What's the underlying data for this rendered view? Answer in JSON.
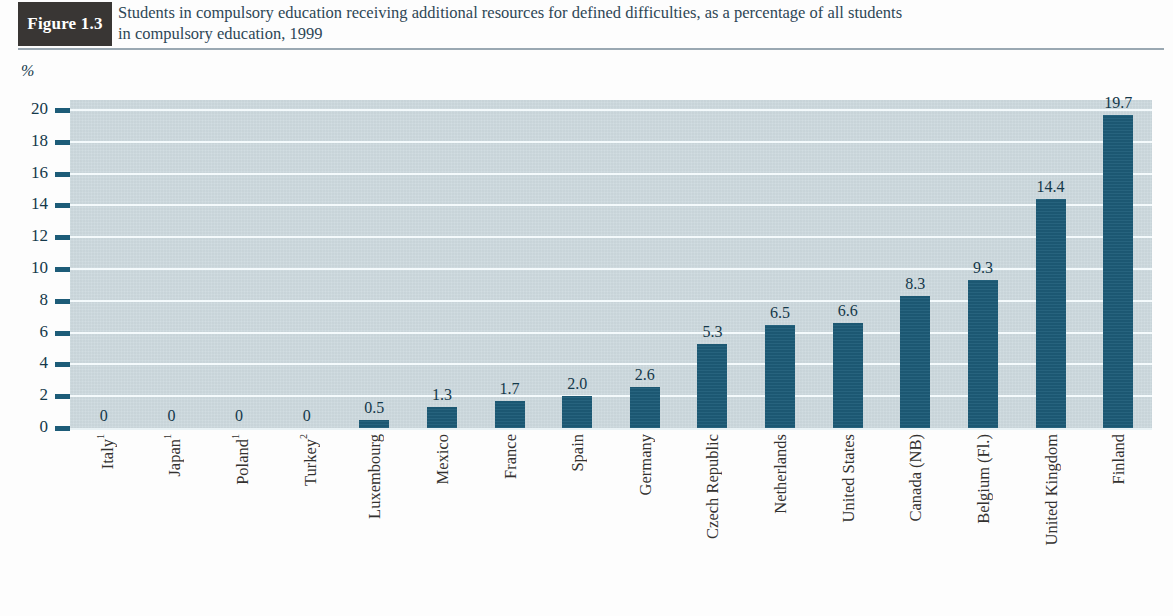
{
  "figure": {
    "tag": "Figure 1.3",
    "title_line1": "Students in compulsory education receiving additional resources for defined difficulties, as a percentage of all students",
    "title_line2": "in compulsory education, 1999"
  },
  "colors": {
    "bar": "#1d5c78",
    "plot_background": "#ccd9de",
    "gridline": "#f4fafc",
    "tag_background": "#393634",
    "title_text": "#2e4756",
    "axis_text": "#14384a"
  },
  "chart_data": {
    "type": "bar",
    "title": "Students in compulsory education receiving additional resources for defined difficulties, as a percentage of all students in compulsory education, 1999",
    "xlabel": "",
    "ylabel": "%",
    "ylim": [
      0,
      20
    ],
    "yticks": [
      0,
      2,
      4,
      6,
      8,
      10,
      12,
      14,
      16,
      18,
      20
    ],
    "ytick_labels": [
      "0",
      "2",
      "4",
      "6",
      "8",
      "10",
      "12",
      "14",
      "16",
      "18",
      "20"
    ],
    "grid": true,
    "legend": "none",
    "categories": [
      "Italy",
      "Japan",
      "Poland",
      "Turkey",
      "Luxembourg",
      "Mexico",
      "France",
      "Spain",
      "Germany",
      "Czech Republic",
      "Netherlands",
      "United States",
      "Canada (NB)",
      "Belgium (Fl.)",
      "United Kingdom",
      "Finland"
    ],
    "category_footnotes": [
      "1",
      "1",
      "1",
      "2",
      "",
      "",
      "",
      "",
      "",
      "",
      "",
      "",
      "",
      "",
      "",
      ""
    ],
    "values": [
      0,
      0,
      0,
      0,
      0.5,
      1.3,
      1.7,
      2.0,
      2.6,
      5.3,
      6.5,
      6.6,
      8.3,
      9.3,
      14.4,
      19.7
    ],
    "value_labels": [
      "0",
      "0",
      "0",
      "0",
      "0.5",
      "1.3",
      "1.7",
      "2.0",
      "2.6",
      "5.3",
      "6.5",
      "6.6",
      "8.3",
      "9.3",
      "14.4",
      "19.7"
    ]
  }
}
